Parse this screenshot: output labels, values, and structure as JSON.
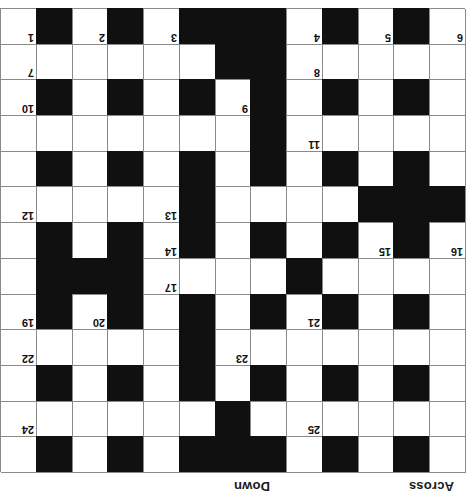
{
  "page": {
    "orientation": "upside-down",
    "rotation_degrees": 180,
    "background_color": "#ffffff"
  },
  "headings": {
    "across_label": "Across",
    "down_label": "Down"
  },
  "grid": {
    "columns": 13,
    "rows": 13,
    "cell_size_px": 35.7,
    "line_color": "#8a8a8a",
    "block_color": "#101010",
    "white_color": "#ffffff",
    "blocks": [
      [
        1,
        1
      ],
      [
        1,
        3
      ],
      [
        1,
        5
      ],
      [
        1,
        6
      ],
      [
        1,
        7
      ],
      [
        1,
        9
      ],
      [
        1,
        11
      ],
      [
        2,
        6
      ],
      [
        3,
        1
      ],
      [
        3,
        3
      ],
      [
        3,
        5
      ],
      [
        3,
        7
      ],
      [
        3,
        9
      ],
      [
        3,
        11
      ],
      [
        4,
        7
      ],
      [
        5,
        1
      ],
      [
        5,
        3
      ],
      [
        5,
        5
      ],
      [
        5,
        7
      ],
      [
        5,
        9
      ],
      [
        5,
        11
      ],
      [
        6,
        4
      ],
      [
        6,
        9
      ],
      [
        6,
        10
      ],
      [
        6,
        11
      ],
      [
        7,
        1
      ],
      [
        7,
        3
      ],
      [
        7,
        5
      ],
      [
        7,
        7
      ],
      [
        7,
        9
      ],
      [
        7,
        11
      ],
      [
        8,
        0
      ],
      [
        8,
        1
      ],
      [
        8,
        2
      ],
      [
        8,
        7
      ],
      [
        9,
        1
      ],
      [
        9,
        3
      ],
      [
        9,
        5
      ],
      [
        9,
        7
      ],
      [
        9,
        9
      ],
      [
        9,
        11
      ],
      [
        10,
        5
      ],
      [
        11,
        1
      ],
      [
        11,
        3
      ],
      [
        11,
        5
      ],
      [
        11,
        7
      ],
      [
        11,
        9
      ],
      [
        11,
        11
      ],
      [
        12,
        5
      ],
      [
        12,
        6
      ],
      [
        13,
        1
      ],
      [
        13,
        3
      ],
      [
        13,
        5
      ],
      [
        13,
        6
      ],
      [
        13,
        7
      ],
      [
        13,
        9
      ],
      [
        13,
        11
      ]
    ],
    "numbers": [
      {
        "n": "1",
        "row": 13,
        "col": 12
      },
      {
        "n": "2",
        "row": 13,
        "col": 10
      },
      {
        "n": "3",
        "row": 13,
        "col": 8
      },
      {
        "n": "4",
        "row": 13,
        "col": 4
      },
      {
        "n": "5",
        "row": 13,
        "col": 2
      },
      {
        "n": "6",
        "row": 13,
        "col": 0
      },
      {
        "n": "7",
        "row": 12,
        "col": 12
      },
      {
        "n": "8",
        "row": 12,
        "col": 4
      },
      {
        "n": "9",
        "row": 11,
        "col": 6
      },
      {
        "n": "10",
        "row": 11,
        "col": 12
      },
      {
        "n": "11",
        "row": 10,
        "col": 4
      },
      {
        "n": "12",
        "row": 8,
        "col": 12
      },
      {
        "n": "13",
        "row": 8,
        "col": 8
      },
      {
        "n": "14",
        "row": 7,
        "col": 8
      },
      {
        "n": "15",
        "row": 7,
        "col": 2
      },
      {
        "n": "16",
        "row": 7,
        "col": 0
      },
      {
        "n": "17",
        "row": 6,
        "col": 8
      },
      {
        "n": "18",
        "row": 6,
        "col": 4
      },
      {
        "n": "19",
        "row": 5,
        "col": 12
      },
      {
        "n": "20",
        "row": 5,
        "col": 10
      },
      {
        "n": "21",
        "row": 5,
        "col": 4
      },
      {
        "n": "22",
        "row": 4,
        "col": 12
      },
      {
        "n": "23",
        "row": 4,
        "col": 6
      },
      {
        "n": "24",
        "row": 2,
        "col": 12
      },
      {
        "n": "25",
        "row": 2,
        "col": 4
      }
    ]
  }
}
